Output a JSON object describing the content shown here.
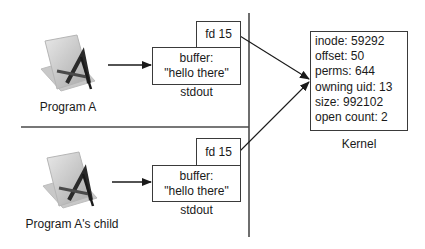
{
  "processes": [
    {
      "name": "Program A",
      "icon": "app-icon",
      "fd_label": "fd 15",
      "buffer_label": "buffer:",
      "buffer_value": "\"hello there\"",
      "stream_label": "stdout"
    },
    {
      "name": "Program A's child",
      "icon": "app-icon",
      "fd_label": "fd 15",
      "buffer_label": "buffer:",
      "buffer_value": "\"hello there\"",
      "stream_label": "stdout"
    }
  ],
  "kernel": {
    "label": "Kernel",
    "entries": [
      "inode: 59292",
      "offset: 50",
      "perms: 644",
      "owning uid: 13",
      "size: 992102",
      "open count: 2"
    ]
  }
}
